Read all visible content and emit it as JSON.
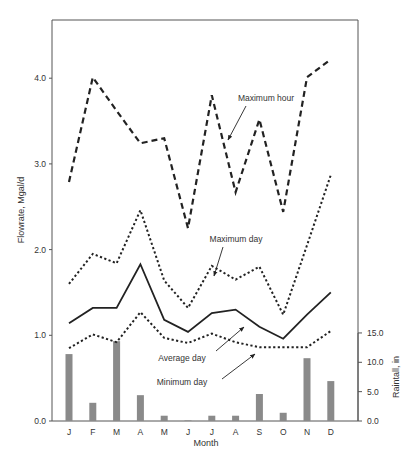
{
  "chart_data": {
    "type": "line",
    "title": "",
    "xlabel": "Month",
    "ylabel": "Flowrate, Mgal/d",
    "y2label": "Raintall, in",
    "categories": [
      "J",
      "F",
      "M",
      "A",
      "M",
      "J",
      "J",
      "A",
      "S",
      "O",
      "N",
      "D"
    ],
    "ylim": [
      0,
      4.6
    ],
    "yticks": [
      "0.0",
      "1.0",
      "2.0",
      "3.0",
      "4.0"
    ],
    "y2lim": [
      0,
      15
    ],
    "y2ticks": [
      "0.0",
      "5.0",
      "10.0",
      "15.0"
    ],
    "grid": false,
    "series": [
      {
        "name": "Maximum hour",
        "style": "dashed",
        "values": [
          2.79,
          4.01,
          3.62,
          3.24,
          3.3,
          2.25,
          3.8,
          2.67,
          3.52,
          2.44,
          4.01,
          4.22
        ]
      },
      {
        "name": "Maximum day",
        "style": "dotted",
        "values": [
          1.6,
          1.95,
          1.84,
          2.46,
          1.64,
          1.32,
          1.81,
          1.65,
          1.8,
          1.24,
          2.05,
          2.87
        ]
      },
      {
        "name": "Average day",
        "style": "solid",
        "values": [
          1.14,
          1.32,
          1.32,
          1.83,
          1.18,
          1.04,
          1.26,
          1.3,
          1.1,
          0.96,
          1.24,
          1.5
        ]
      },
      {
        "name": "Minimum day",
        "style": "dotted",
        "values": [
          0.85,
          1.01,
          0.92,
          1.27,
          0.97,
          0.91,
          1.02,
          0.92,
          0.86,
          0.86,
          0.86,
          1.05
        ]
      },
      {
        "name": "Rainfall",
        "type": "bar",
        "axis": "right",
        "values": [
          11.4,
          3.1,
          13.6,
          4.4,
          0.9,
          0.1,
          0.9,
          0.9,
          4.6,
          1.4,
          10.7,
          6.8
        ]
      }
    ],
    "annotations": [
      {
        "text": "Maximum hour",
        "x": 266,
        "y": 101
      },
      {
        "text": "Maximum day",
        "x": 236,
        "y": 242
      },
      {
        "text": "Average day",
        "x": 182,
        "y": 361
      },
      {
        "text": "Minimum day",
        "x": 182,
        "y": 385
      }
    ]
  }
}
